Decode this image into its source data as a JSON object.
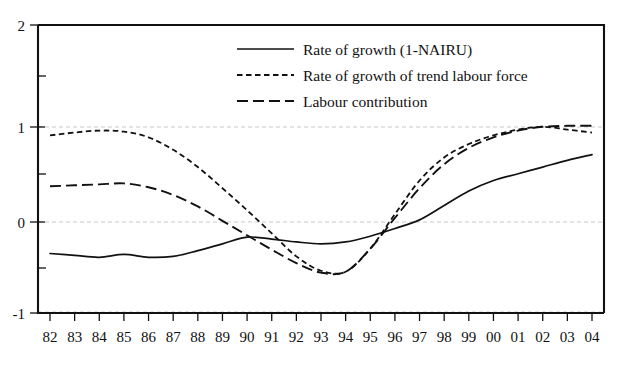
{
  "chart_data": {
    "type": "line",
    "title": "",
    "subtitle": "",
    "xlabel": "",
    "ylabel": "",
    "xlim": [
      1982,
      2004
    ],
    "ylim": [
      -1,
      2
    ],
    "grid": true,
    "gridlines_y": [
      1,
      0,
      -1
    ],
    "legend_position": "top-center",
    "y_ticks": [
      2,
      1,
      0,
      -1
    ],
    "y_ticklabels": [
      "2",
      "1",
      "0",
      "-1"
    ],
    "x": [
      1982,
      1983,
      1984,
      1985,
      1986,
      1987,
      1988,
      1989,
      1990,
      1991,
      1992,
      1993,
      1994,
      1995,
      1996,
      1997,
      1998,
      1999,
      2000,
      2001,
      2002,
      2003,
      2004
    ],
    "categories": [
      "82",
      "83",
      "84",
      "85",
      "86",
      "87",
      "88",
      "89",
      "90",
      "91",
      "92",
      "93",
      "94",
      "95",
      "96",
      "97",
      "98",
      "99",
      "00",
      "01",
      "02",
      "03",
      "04"
    ],
    "series": [
      {
        "name": "Rate of growth (1-NAIRU)",
        "style": "solid",
        "color": "#111111",
        "values": [
          -0.38,
          -0.4,
          -0.42,
          -0.39,
          -0.42,
          -0.41,
          -0.35,
          -0.28,
          -0.21,
          -0.23,
          -0.26,
          -0.28,
          -0.26,
          -0.2,
          -0.12,
          -0.03,
          0.12,
          0.27,
          0.38,
          0.45,
          0.52,
          0.59,
          0.65
        ]
      },
      {
        "name": "Rate of growth of trend labour force",
        "style": "short-dash",
        "color": "#111111",
        "values": [
          0.85,
          0.88,
          0.9,
          0.89,
          0.83,
          0.7,
          0.52,
          0.3,
          0.07,
          -0.17,
          -0.41,
          -0.56,
          -0.57,
          -0.33,
          0.03,
          0.38,
          0.62,
          0.76,
          0.85,
          0.91,
          0.94,
          0.91,
          0.88
        ]
      },
      {
        "name": "Labour contribution",
        "style": "long-dash",
        "color": "#111111",
        "values": [
          0.32,
          0.33,
          0.34,
          0.35,
          0.31,
          0.23,
          0.11,
          -0.04,
          -0.19,
          -0.34,
          -0.48,
          -0.58,
          -0.57,
          -0.33,
          -0.01,
          0.3,
          0.55,
          0.72,
          0.83,
          0.9,
          0.94,
          0.95,
          0.95
        ]
      }
    ],
    "legend": [
      {
        "label": "Rate of growth (1-NAIRU)",
        "style": "solid"
      },
      {
        "label": "Rate of growth of trend labour force",
        "style": "short-dash"
      },
      {
        "label": "Labour contribution",
        "style": "long-dash"
      }
    ]
  }
}
